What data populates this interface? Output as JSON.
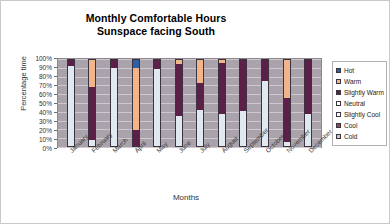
{
  "chart_data": {
    "type": "bar",
    "title": "Monthly Comfortable Hours",
    "subtitle": "Sunspace facing South",
    "xlabel": "Months",
    "ylabel": "Percentage time",
    "ylim": [
      0,
      100
    ],
    "yticks": [
      "0%",
      "10%",
      "20%",
      "30%",
      "40%",
      "50%",
      "60%",
      "70%",
      "80%",
      "90%",
      "100%"
    ],
    "grid": true,
    "stacked": true,
    "legend_position": "right",
    "categories": [
      "January",
      "February",
      "March",
      "April",
      "May",
      "June",
      "July",
      "August",
      "September",
      "October",
      "November",
      "December"
    ],
    "series": [
      {
        "name": "Cold",
        "color": "#c8c4cc",
        "values": [
          0,
          0,
          0,
          0,
          0,
          0,
          0,
          0,
          0,
          0,
          0,
          0
        ]
      },
      {
        "name": "Cool",
        "color": "#8c4a4a",
        "values": [
          0,
          0,
          0,
          0,
          0,
          0,
          0,
          0,
          0,
          0,
          0,
          0
        ]
      },
      {
        "name": "Slightly Cool",
        "color": "#dfe9ef",
        "values": [
          92,
          8,
          90,
          0,
          89,
          35,
          42,
          37,
          41,
          75,
          6,
          37
        ]
      },
      {
        "name": "Neutral",
        "color": "#ffffff",
        "values": [
          0,
          0,
          0,
          0,
          0,
          0,
          0,
          0,
          0,
          0,
          0,
          0
        ]
      },
      {
        "name": "Slightly Warm",
        "color": "#5c1f47",
        "values": [
          8,
          60,
          10,
          19,
          11,
          59,
          31,
          58,
          59,
          25,
          50,
          63
        ]
      },
      {
        "name": "Warm",
        "color": "#f2b48a",
        "values": [
          0,
          32,
          0,
          71,
          0,
          6,
          27,
          5,
          0,
          0,
          44,
          0
        ]
      },
      {
        "name": "Hot",
        "color": "#2e5fa3",
        "values": [
          0,
          0,
          0,
          10,
          0,
          0,
          0,
          0,
          0,
          0,
          0,
          0
        ]
      }
    ]
  },
  "legend": {
    "items": [
      {
        "label": "Hot",
        "color": "#2e5fa3"
      },
      {
        "label": "Warm",
        "color": "#f2b48a"
      },
      {
        "label": "Slightly Warm",
        "color": "#5c1f47"
      },
      {
        "label": "Neutral",
        "color": "#ffffff"
      },
      {
        "label": "Slightly Cool",
        "color": "#fbfcfd"
      },
      {
        "label": "Cool",
        "color": "#8c4a4a"
      },
      {
        "label": "Cold",
        "color": "#c8c4cc"
      }
    ]
  }
}
